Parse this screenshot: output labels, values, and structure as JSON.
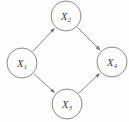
{
  "figure": {
    "type": "directed-acyclic-graph",
    "shape": "diamond",
    "background_color": "#fdfdfc",
    "stroke_color": "#7a7a78",
    "label_color": "#3a3a39"
  },
  "nodes": [
    {
      "id": "x1",
      "base": "X",
      "subscript": "1",
      "label": "X1",
      "cx": 22,
      "cy": 63,
      "r": 15
    },
    {
      "id": "x2",
      "base": "X",
      "subscript": "2",
      "label": "X2",
      "cx": 66,
      "cy": 16,
      "r": 15
    },
    {
      "id": "x3",
      "base": "X",
      "subscript": "3",
      "label": "X3",
      "cx": 67,
      "cy": 104,
      "r": 15
    },
    {
      "id": "x4",
      "base": "X",
      "subscript": "4",
      "label": "X4",
      "cx": 112,
      "cy": 62,
      "r": 15
    }
  ],
  "edges": [
    {
      "id": "e1",
      "from": "x1",
      "to": "x2",
      "label": "X1 to X2",
      "directed": true
    },
    {
      "id": "e2",
      "from": "x1",
      "to": "x3",
      "label": "X1 to X3",
      "directed": true
    },
    {
      "id": "e3",
      "from": "x2",
      "to": "x4",
      "label": "X2 to X4",
      "directed": true
    },
    {
      "id": "e4",
      "from": "x3",
      "to": "x4",
      "label": "X3 to X4",
      "directed": true
    }
  ]
}
